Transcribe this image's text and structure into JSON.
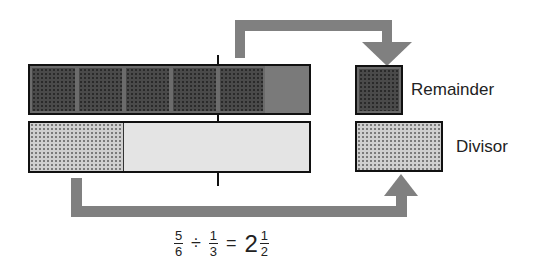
{
  "diagram": {
    "dividend_bar": {
      "cells": 6,
      "shaded_cells": 5,
      "label": "5/6"
    },
    "divisor_bar": {
      "parts": 3,
      "shaded_parts": 1,
      "label": "1/3"
    },
    "legend": {
      "remainder_label": "Remainder",
      "divisor_label": "Divisor"
    },
    "equation": {
      "dividend_num": "5",
      "dividend_den": "6",
      "operator": "÷",
      "divisor_num": "1",
      "divisor_den": "3",
      "equals": "=",
      "result_whole": "2",
      "result_num": "1",
      "result_den": "2"
    },
    "colors": {
      "arrow": "#808080",
      "dark_fill": "#4a4a4a",
      "light_fill": "#cfcfcf",
      "plain_light": "#e4e4e4",
      "outline": "#111111"
    }
  }
}
